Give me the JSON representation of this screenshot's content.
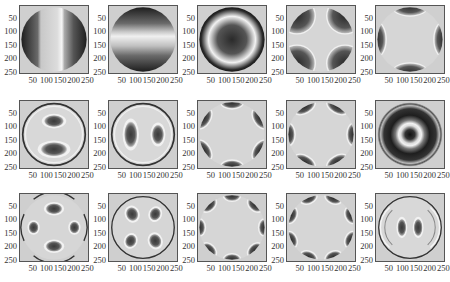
{
  "figure": {
    "rows": 3,
    "cols": 5,
    "x_ticks": [
      "50",
      "100",
      "150",
      "200",
      "250"
    ],
    "y_ticks": [
      "50",
      "100",
      "150",
      "200",
      "250"
    ],
    "axis_range": [
      0,
      256
    ],
    "colormap": "gray",
    "colors": {
      "background": "#cfcfcf",
      "light": "#e6e6e6",
      "dark": "#2a2a2a",
      "mid": "#8a8a8a",
      "axes": "#555555"
    }
  },
  "panels": [
    {
      "id": 1,
      "row": 0,
      "col": 0,
      "pattern": "vertical-stripe",
      "description": "Light vertical band in center, dark left and right edges"
    },
    {
      "id": 2,
      "row": 0,
      "col": 1,
      "pattern": "horizontal-stripe",
      "description": "Light horizontal band in center, dark top and bottom"
    },
    {
      "id": 3,
      "row": 0,
      "col": 2,
      "pattern": "ring-dark-center",
      "description": "Dark center disk, light ring, dark outer ring"
    },
    {
      "id": 4,
      "row": 0,
      "col": 3,
      "pattern": "four-lobes-diagonal",
      "description": "Four dark lobes at diagonal corners, light cross"
    },
    {
      "id": 5,
      "row": 0,
      "col": 4,
      "pattern": "four-lobes-axial",
      "description": "Four dark lobes at top, bottom, left, right"
    },
    {
      "id": 6,
      "row": 1,
      "col": 0,
      "pattern": "two-lobes-vertical",
      "description": "Two dark lobes stacked vertically with thin outer ring"
    },
    {
      "id": 7,
      "row": 1,
      "col": 1,
      "pattern": "two-lobes-horizontal",
      "description": "Two dark lobes side by side with thin outer ring"
    },
    {
      "id": 8,
      "row": 1,
      "col": 2,
      "pattern": "six-lobes-a",
      "description": "Six dark lobes around edge, light hexagonal center"
    },
    {
      "id": 9,
      "row": 1,
      "col": 3,
      "pattern": "six-lobes-b",
      "description": "Six dark lobes around edge, rotated"
    },
    {
      "id": 10,
      "row": 1,
      "col": 4,
      "pattern": "concentric-rings",
      "description": "Dark center, light ring, dark ring, thin outer ring"
    },
    {
      "id": 11,
      "row": 2,
      "col": 0,
      "pattern": "four-lobes-axial-inner",
      "description": "Four dark inner lobes on axes with outer arcs"
    },
    {
      "id": 12,
      "row": 2,
      "col": 1,
      "pattern": "four-lobes-diagonal-inner",
      "description": "Four dark inner lobes on diagonals with outer ring"
    },
    {
      "id": 13,
      "row": 2,
      "col": 2,
      "pattern": "eight-lobes-a",
      "description": "Eight dark lobes around edge"
    },
    {
      "id": 14,
      "row": 2,
      "col": 3,
      "pattern": "eight-lobes-b",
      "description": "Eight dark lobes around edge, rotated"
    },
    {
      "id": 15,
      "row": 2,
      "col": 4,
      "pattern": "two-lobes-horizontal-arcs",
      "description": "Two dark central lobes with concentric arc fringes"
    }
  ]
}
